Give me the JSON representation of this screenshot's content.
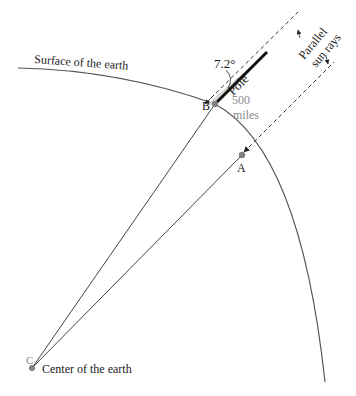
{
  "figure": {
    "type": "diagram",
    "labels": {
      "surface": "Surface of the earth",
      "center_point": "C",
      "center_text": "Center of the earth",
      "point_b": "B",
      "point_a": "A",
      "distance_value": "500",
      "distance_unit": "miles",
      "angle": "7.2°",
      "pole": "Pole",
      "sun_rays_line1": "Parallel",
      "sun_rays_line2": "sun rays"
    },
    "colors": {
      "line": "#333333",
      "arc": "#555555",
      "point": "#808080",
      "shadow_fill": "#d8d8d8",
      "gray_text": "#8a8a8a"
    },
    "points": {
      "C": [
        32,
        368
      ],
      "B": [
        215,
        104
      ],
      "A": [
        242,
        155
      ]
    }
  }
}
